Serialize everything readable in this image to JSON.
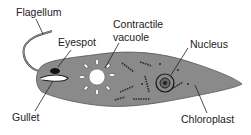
{
  "diagram": {
    "labels": {
      "flagellum": "Flagellum",
      "eyespot": "Eyespot",
      "contractile_vacuole_line1": "Contractile",
      "contractile_vacuole_line2": "vacuole",
      "nucleus": "Nucleus",
      "gullet": "Gullet",
      "chloroplast": "Chloroplast"
    },
    "colors": {
      "body_fill": "#8a8a8a",
      "outline": "#333333",
      "vacuole": "#ffffff",
      "text": "#222222"
    }
  }
}
